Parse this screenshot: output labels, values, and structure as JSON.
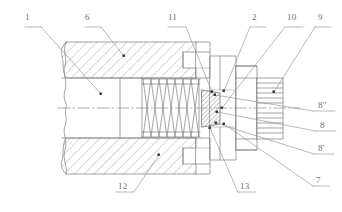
{
  "figure": {
    "type": "patent-cross-section-drawing",
    "title": "",
    "background_color": "#ffffff",
    "line_color": "#7d7d7d",
    "hatch_color": "#8c8c8c",
    "label_color": "#6e6e6e",
    "width": 342,
    "height": 212
  },
  "callouts": [
    {
      "id": "callout-1",
      "label": "1",
      "x": 25,
      "y": 18,
      "underline_width": 16,
      "leader": [
        [
          41,
          27
        ],
        [
          101,
          94
        ]
      ],
      "dot": [
        101,
        94
      ]
    },
    {
      "id": "callout-6",
      "label": "6",
      "x": 85,
      "y": 18,
      "underline_width": 16,
      "leader": [
        [
          101,
          27
        ],
        [
          124,
          56
        ]
      ],
      "dot": [
        124,
        56
      ]
    },
    {
      "id": "callout-11",
      "label": "11",
      "x": 168,
      "y": 18,
      "underline_width": 18,
      "leader": [
        [
          186,
          27
        ],
        [
          212,
          92
        ]
      ],
      "dot": [
        212,
        92
      ]
    },
    {
      "id": "callout-2",
      "label": "2",
      "x": 250,
      "y": 18,
      "underline_width": 16,
      "leader": [
        [
          250,
          27
        ],
        [
          224,
          91
        ]
      ],
      "dot": [
        224,
        91
      ]
    },
    {
      "id": "callout-10",
      "label": "10",
      "x": 285,
      "y": 18,
      "underline_width": 18,
      "leader": [
        [
          285,
          27
        ],
        [
          222,
          108
        ]
      ],
      "dot": [
        222,
        108
      ]
    },
    {
      "id": "callout-9",
      "label": "9",
      "x": 315,
      "y": 18,
      "underline_width": 16,
      "leader": [
        [
          315,
          27
        ],
        [
          274,
          92
        ]
      ],
      "dot": [
        274,
        92
      ]
    },
    {
      "id": "callout-8dd",
      "label": "8\"",
      "x": 313,
      "y": 103,
      "underline_width": 22,
      "leader": [
        [
          313,
          111
        ],
        [
          215,
          95
        ]
      ],
      "dot": [
        215,
        95
      ]
    },
    {
      "id": "callout-8",
      "label": "8",
      "x": 316,
      "y": 123,
      "underline_width": 20,
      "leader": [
        [
          316,
          131
        ],
        [
          217,
          112
        ]
      ],
      "dot": [
        217,
        112
      ]
    },
    {
      "id": "callout-8p",
      "label": "8'",
      "x": 314,
      "y": 146,
      "underline_width": 20,
      "leader": [
        [
          314,
          154
        ],
        [
          216,
          123
        ]
      ],
      "dot": [
        216,
        123
      ]
    },
    {
      "id": "callout-7",
      "label": "7",
      "x": 313,
      "y": 178,
      "underline_width": 16,
      "leader": [
        [
          313,
          186
        ],
        [
          224,
          124
        ]
      ],
      "dot": [
        224,
        124
      ]
    },
    {
      "id": "callout-13",
      "label": "13",
      "x": 238,
      "y": 184,
      "underline_width": 18,
      "leader": [
        [
          238,
          192
        ],
        [
          210,
          128
        ]
      ],
      "dot": [
        210,
        128
      ]
    },
    {
      "id": "callout-12",
      "label": "12",
      "x": 116,
      "y": 184,
      "underline_width": 18,
      "leader": [
        [
          134,
          192
        ],
        [
          159,
          155
        ]
      ],
      "dot": [
        159,
        155
      ]
    }
  ],
  "components": {
    "body_outer": "housing-body",
    "spring": "coil-spring",
    "seal_block": "hatched-seal-element",
    "threaded_nut": "ribbed-threaded-section",
    "axis": "center-axis-line",
    "break_line": "wavy-break-line"
  },
  "geometry": {
    "axis_y": 108,
    "body_left": 62,
    "body_right": 196,
    "body_top": 42,
    "body_bottom": 174,
    "spring_left": 142,
    "spring_right": 200,
    "spring_top": 78,
    "spring_bottom": 138,
    "spring_coils": 7,
    "seal_left": 202,
    "seal_right": 220,
    "seal_top": 90,
    "seal_bottom": 127,
    "nut_left": 257,
    "nut_right": 283,
    "nut_top": 78,
    "nut_bottom": 139,
    "nut_ribs": 12
  }
}
